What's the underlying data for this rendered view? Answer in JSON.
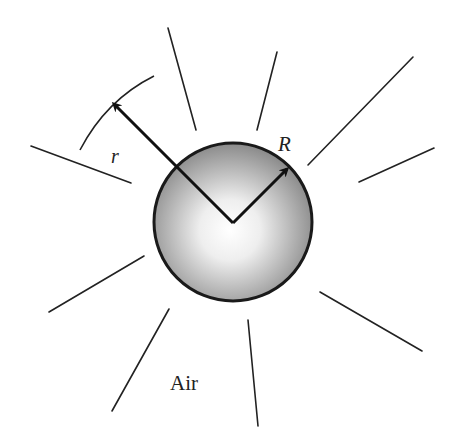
{
  "diagram": {
    "labels": {
      "small_radius": "r",
      "sphere_radius": "R",
      "medium": "Air"
    },
    "sphere": {
      "cx": 233,
      "cy": 222,
      "r": 79,
      "stroke": "#1a1a1a",
      "fill_center": "#ffffff",
      "fill_edge": "#8c8c8c"
    },
    "rays": [
      {
        "x1": 168,
        "y1": 28,
        "x2": 196,
        "y2": 130
      },
      {
        "x1": 277,
        "y1": 52,
        "x2": 257,
        "y2": 130
      },
      {
        "x1": 308,
        "y1": 165,
        "x2": 413,
        "y2": 57
      },
      {
        "x1": 359,
        "y1": 182,
        "x2": 434,
        "y2": 148
      },
      {
        "x1": 31,
        "y1": 146,
        "x2": 131,
        "y2": 183
      },
      {
        "x1": 144,
        "y1": 256,
        "x2": 49,
        "y2": 312
      },
      {
        "x1": 169,
        "y1": 309,
        "x2": 112,
        "y2": 411
      },
      {
        "x1": 248,
        "y1": 320,
        "x2": 258,
        "y2": 426
      },
      {
        "x1": 320,
        "y1": 292,
        "x2": 422,
        "y2": 351
      }
    ]
  }
}
